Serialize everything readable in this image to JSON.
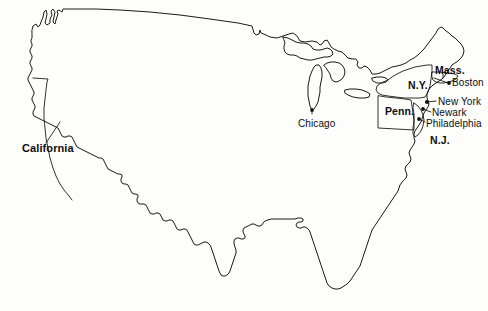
{
  "map": {
    "title": "United States outline map with Northeast corridor detail",
    "background_color": "#fdfdfc",
    "line_color": "#1a1a1a",
    "projection_note": "Contiguous United States, no Alaska or Hawaii",
    "state_labels": [
      {
        "id": "california",
        "text": "California",
        "x": 22,
        "y": 143,
        "style": "bold",
        "has_leader": true
      },
      {
        "id": "pennsylvania",
        "text": "Penn.",
        "x": 385,
        "y": 106,
        "style": "bold",
        "has_leader": false
      },
      {
        "id": "new-york",
        "text": "N.Y.",
        "x": 408,
        "y": 80,
        "style": "bold",
        "has_leader": false
      },
      {
        "id": "massachusetts",
        "text": "Mass.",
        "x": 435,
        "y": 65,
        "style": "bold",
        "has_leader": true
      },
      {
        "id": "new-jersey",
        "text": "N.J.",
        "x": 430,
        "y": 135,
        "style": "bold",
        "has_leader": false
      }
    ],
    "city_labels": [
      {
        "id": "chicago",
        "text": "Chicago",
        "x": 298,
        "y": 119,
        "style": "regular",
        "dot_x": 312,
        "dot_y": 110
      },
      {
        "id": "boston",
        "text": "Boston",
        "x": 452,
        "y": 80,
        "style": "regular",
        "dot_x": 449,
        "dot_y": 83
      },
      {
        "id": "new-york-city",
        "text": "New York",
        "x": 438,
        "y": 99,
        "style": "regular",
        "dot_x": 427,
        "dot_y": 102
      },
      {
        "id": "newark",
        "text": "Newark",
        "x": 432,
        "y": 110,
        "style": "regular",
        "dot_x": 424,
        "dot_y": 109
      },
      {
        "id": "philadelphia",
        "text": "Philadelphia",
        "x": 426,
        "y": 121,
        "style": "regular",
        "dot_x": 419,
        "dot_y": 119
      }
    ],
    "features": {
      "great_lakes": [
        "Lake Superior",
        "Lake Michigan",
        "Lake Huron",
        "Lake Erie",
        "Lake Ontario"
      ],
      "outlined_states": [
        "California",
        "Pennsylvania",
        "New York",
        "Massachusetts",
        "New Jersey"
      ]
    }
  }
}
